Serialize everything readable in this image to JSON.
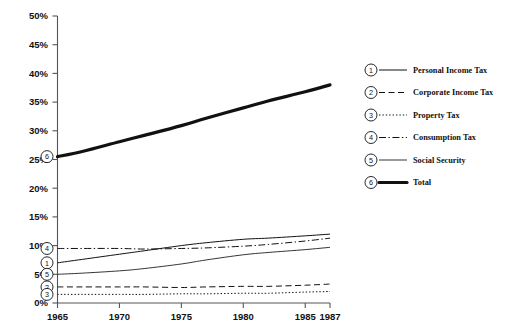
{
  "chart_data": {
    "type": "line",
    "title": "",
    "subtitle": "",
    "xlabel": "",
    "ylabel": "",
    "xlim": [
      1965,
      1987
    ],
    "ylim": [
      0,
      50
    ],
    "grid": false,
    "legend_position": "right",
    "y_tick_labels": [
      "0%",
      "5%",
      "10%",
      "15%",
      "20%",
      "25%",
      "30%",
      "35%",
      "40%",
      "45%",
      "50%"
    ],
    "y_tick_values": [
      0,
      5,
      10,
      15,
      20,
      25,
      30,
      35,
      40,
      45,
      50
    ],
    "x_tick_labels": [
      "1965",
      "1970",
      "1975",
      "1980",
      "1985",
      "1987"
    ],
    "x_tick_values": [
      1965,
      1970,
      1975,
      1980,
      1985,
      1987
    ],
    "x": [
      1965,
      1967,
      1970,
      1972,
      1975,
      1977,
      1980,
      1982,
      1985,
      1987
    ],
    "series": [
      {
        "key": "personal",
        "number": "1",
        "name": "Personal Income Tax",
        "style": "solid",
        "values": [
          7.0,
          7.6,
          8.5,
          9.1,
          10.0,
          10.5,
          11.1,
          11.3,
          11.7,
          12.0
        ]
      },
      {
        "key": "corporate",
        "number": "2",
        "name": "Corporate Income Tax",
        "style": "dashed",
        "values": [
          2.8,
          2.8,
          2.8,
          2.8,
          2.7,
          2.8,
          2.9,
          2.9,
          3.1,
          3.3
        ]
      },
      {
        "key": "property",
        "number": "3",
        "name": "Property Tax",
        "style": "dotted",
        "values": [
          1.5,
          1.5,
          1.5,
          1.5,
          1.6,
          1.6,
          1.7,
          1.7,
          1.9,
          2.0
        ]
      },
      {
        "key": "consumption",
        "number": "4",
        "name": "Consumption Tax",
        "style": "dash-dot",
        "values": [
          9.5,
          9.5,
          9.5,
          9.4,
          9.5,
          9.6,
          9.9,
          10.2,
          10.8,
          11.3
        ]
      },
      {
        "key": "social",
        "number": "5",
        "name": "Social Security",
        "style": "thin-solid",
        "values": [
          5.0,
          5.2,
          5.6,
          6.0,
          6.8,
          7.5,
          8.4,
          8.8,
          9.3,
          9.7
        ]
      },
      {
        "key": "total",
        "number": "6",
        "name": "Total",
        "style": "thick-solid",
        "values": [
          25.5,
          26.4,
          28.1,
          29.2,
          30.9,
          32.2,
          34.0,
          35.2,
          36.8,
          38.0
        ]
      }
    ],
    "start_markers": [
      {
        "number": "1",
        "series": "personal",
        "value": 7.0
      },
      {
        "number": "2",
        "series": "corporate",
        "value": 2.8
      },
      {
        "number": "3",
        "series": "property",
        "value": 1.5
      },
      {
        "number": "4",
        "series": "consumption",
        "value": 9.5
      },
      {
        "number": "5",
        "series": "social",
        "value": 5.0
      },
      {
        "number": "6",
        "series": "total",
        "value": 25.5
      }
    ]
  },
  "legend": {
    "entries": [
      {
        "number": "1",
        "label": "Personal Income Tax"
      },
      {
        "number": "2",
        "label": "Corporate Income Tax"
      },
      {
        "number": "3",
        "label": "Property Tax"
      },
      {
        "number": "4",
        "label": "Consumption Tax"
      },
      {
        "number": "5",
        "label": "Social Security"
      },
      {
        "number": "6",
        "label": "Total"
      }
    ]
  }
}
